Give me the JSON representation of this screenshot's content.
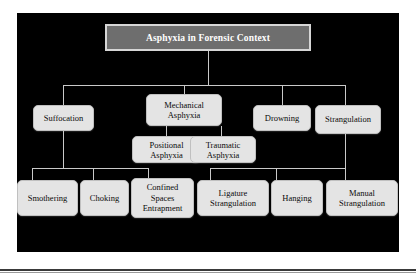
{
  "diagram": {
    "title": "Asphyxia in Forensic Context",
    "type": "hierarchy-tree",
    "panel_background": "#000000",
    "node_fill": "#e4e4e4",
    "node_text_color": "#0b0b0b",
    "root_fill": "#6e6e6e",
    "root_text_color": "#ffffff",
    "connector_color": "#c9c9c9",
    "levels": [
      {
        "level": 0,
        "nodes": [
          {
            "id": "root",
            "label": "Asphyxia in Forensic Context"
          }
        ]
      },
      {
        "level": 1,
        "nodes": [
          {
            "id": "suffocation",
            "label": "Suffocation",
            "parent": "root"
          },
          {
            "id": "mechanical-asphyxia",
            "label": "Mechanical Asphyxia",
            "parent": "root"
          },
          {
            "id": "drowning",
            "label": "Drowning",
            "parent": "root"
          },
          {
            "id": "strangulation",
            "label": "Strangulation",
            "parent": "root"
          }
        ]
      },
      {
        "level": 2,
        "nodes": [
          {
            "id": "positional-asphyxia",
            "label": "Positional Asphyxia",
            "parent": "mechanical-asphyxia"
          },
          {
            "id": "traumatic-asphyxia",
            "label": "Traumatic Asphyxia",
            "parent": "mechanical-asphyxia"
          }
        ]
      },
      {
        "level": 3,
        "nodes": [
          {
            "id": "smothering",
            "label": "Smothering",
            "parent": "suffocation"
          },
          {
            "id": "choking",
            "label": "Choking",
            "parent": "suffocation"
          },
          {
            "id": "confined-spaces-entrapment",
            "label": "Confined Spaces Entrapment",
            "parent": "suffocation"
          },
          {
            "id": "ligature-strangulation",
            "label": "Ligature Strangulation",
            "parent": "strangulation"
          },
          {
            "id": "hanging",
            "label": "Hanging",
            "parent": "strangulation"
          },
          {
            "id": "manual-strangulation",
            "label": "Manual Strangulation",
            "parent": "strangulation"
          }
        ]
      }
    ],
    "nodes": {
      "root": "Asphyxia in Forensic Context",
      "suffocation": "Suffocation",
      "mechanical_asphyxia_line1": "Mechanical",
      "mechanical_asphyxia_line2": "Asphyxia",
      "drowning": "Drowning",
      "strangulation": "Strangulation",
      "positional_asphyxia_line1": "Positional",
      "positional_asphyxia_line2": "Asphyxia",
      "traumatic_asphyxia_line1": "Traumatic",
      "traumatic_asphyxia_line2": "Asphyxia",
      "smothering": "Smothering",
      "choking": "Choking",
      "confined_line1": "Confined",
      "confined_line2": "Spaces",
      "confined_line3": "Entrapment",
      "ligature_line1": "Ligature",
      "ligature_line2": "Strangulation",
      "hanging": "Hanging",
      "manual_line1": "Manual",
      "manual_line2": "Strangulation"
    }
  }
}
